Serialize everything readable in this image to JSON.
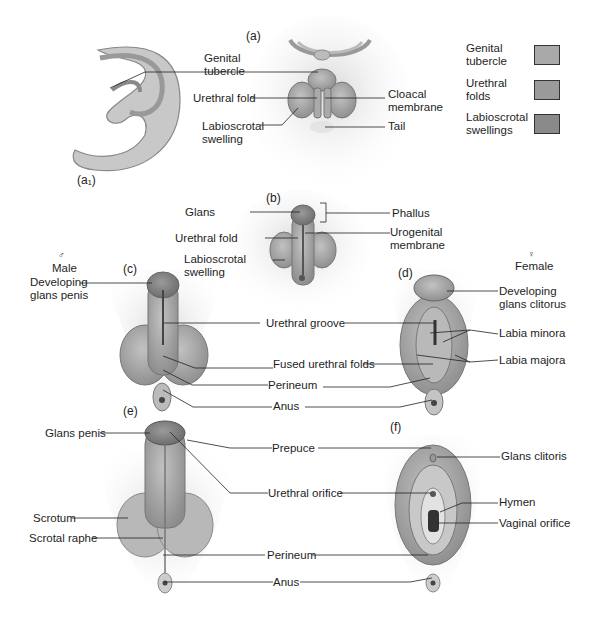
{
  "figure": {
    "panels": {
      "a1": "(a₁)",
      "a": "(a)",
      "b": "(b)",
      "c": "(c)",
      "d": "(d)",
      "e": "(e)",
      "f": "(f)"
    },
    "sex_labels": {
      "male_symbol": "♂",
      "male": "Male",
      "female_symbol": "♀",
      "female": "Female"
    },
    "legend": [
      {
        "label_line1": "Genital",
        "label_line2": "tubercle",
        "color": "#a9a9a9"
      },
      {
        "label_line1": "Urethral",
        "label_line2": "folds",
        "color": "#9a9a9a"
      },
      {
        "label_line1": "Labioscrotal",
        "label_line2": "swellings",
        "color": "#8a8a8a"
      }
    ],
    "panel_a_labels": {
      "genital_tubercle_1": "Genital",
      "genital_tubercle_2": "tubercle",
      "urethral_fold": "Urethral fold",
      "labioscrotal_1": "Labioscrotal",
      "labioscrotal_2": "swelling",
      "cloacal_1": "Cloacal",
      "cloacal_2": "membrane",
      "tail": "Tail"
    },
    "panel_b_labels": {
      "glans": "Glans",
      "urethral_fold": "Urethral fold",
      "labioscrotal_1": "Labioscrotal",
      "labioscrotal_2": "swelling",
      "phallus": "Phallus",
      "urogenital_1": "Urogenital",
      "urogenital_2": "membrane"
    },
    "panel_cd_labels": {
      "dev_glans_penis_1": "Developing",
      "dev_glans_penis_2": "glans penis",
      "dev_glans_clitorus_1": "Developing",
      "dev_glans_clitorus_2": "glans clitorus",
      "urethral_groove": "Urethral groove",
      "fused_urethral_folds": "Fused urethral folds",
      "perineum": "Perineum",
      "anus": "Anus",
      "labia_minora": "Labia minora",
      "labia_majora": "Labia majora"
    },
    "panel_ef_labels": {
      "glans_penis": "Glans penis",
      "scrotum": "Scrotum",
      "scrotal_raphe": "Scrotal raphe",
      "prepuce": "Prepuce",
      "urethral_orifice": "Urethral orifice",
      "perineum": "Perineum",
      "anus": "Anus",
      "glans_clitoris": "Glans clitoris",
      "hymen": "Hymen",
      "vaginal_orifice": "Vaginal orifice"
    }
  }
}
